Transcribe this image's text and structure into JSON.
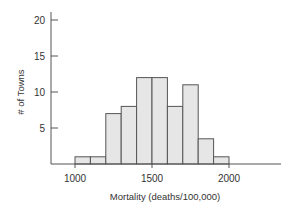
{
  "chart_data": {
    "type": "bar",
    "subtype": "histogram",
    "title": "",
    "xlabel": "Mortality (deaths/100,000)",
    "ylabel": "# of Towns",
    "bin_edges": [
      1000,
      1100,
      1200,
      1300,
      1400,
      1500,
      1600,
      1700,
      1800,
      1900,
      2000
    ],
    "categories": [
      "1000-1100",
      "1100-1200",
      "1200-1300",
      "1300-1400",
      "1400-1500",
      "1500-1600",
      "1600-1700",
      "1700-1800",
      "1800-1900",
      "1900-2000"
    ],
    "values": [
      1,
      1,
      7,
      8,
      12,
      12,
      8,
      11,
      3.5,
      1
    ],
    "xticks": [
      1000,
      1500,
      2000
    ],
    "yticks": [
      5,
      10,
      15,
      20
    ],
    "xlim": [
      850,
      2350
    ],
    "ylim": [
      0,
      20
    ],
    "grid": false,
    "legend": null,
    "colors": {
      "bar_fill": "#e6e6e6",
      "bar_stroke": "#555555",
      "axis": "#555555"
    }
  }
}
